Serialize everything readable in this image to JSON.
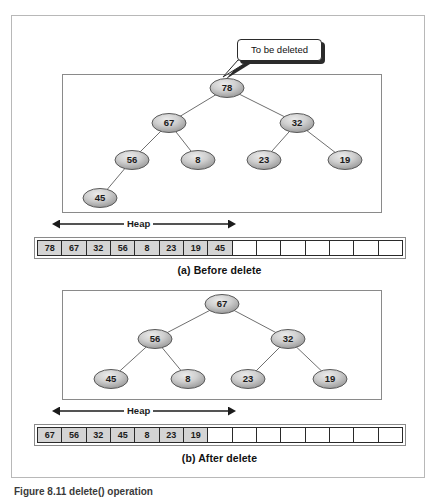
{
  "figure": {
    "caption": "Figure 8.11    delete() operation"
  },
  "callout": {
    "text": "To be deleted"
  },
  "panel_a": {
    "caption": "(a) Before delete",
    "heap_label": "Heap",
    "tree": {
      "nodes": [
        {
          "id": "a-78",
          "label": "78",
          "cx": 227,
          "cy": 88
        },
        {
          "id": "a-67",
          "label": "67",
          "cx": 169,
          "cy": 123
        },
        {
          "id": "a-32",
          "label": "32",
          "cx": 297,
          "cy": 123
        },
        {
          "id": "a-56",
          "label": "56",
          "cx": 132,
          "cy": 160
        },
        {
          "id": "a-8",
          "label": "8",
          "cx": 198,
          "cy": 160
        },
        {
          "id": "a-23",
          "label": "23",
          "cx": 264,
          "cy": 160
        },
        {
          "id": "a-19",
          "label": "19",
          "cx": 345,
          "cy": 160
        },
        {
          "id": "a-45",
          "label": "45",
          "cx": 100,
          "cy": 198
        }
      ],
      "edges": [
        {
          "from": "a-78",
          "to": "a-67"
        },
        {
          "from": "a-78",
          "to": "a-32"
        },
        {
          "from": "a-67",
          "to": "a-56"
        },
        {
          "from": "a-67",
          "to": "a-8"
        },
        {
          "from": "a-32",
          "to": "a-23"
        },
        {
          "from": "a-32",
          "to": "a-19"
        },
        {
          "from": "a-56",
          "to": "a-45"
        }
      ]
    },
    "array": {
      "total_cells": 15,
      "cells": [
        "78",
        "67",
        "32",
        "56",
        "8",
        "23",
        "19",
        "45",
        "",
        "",
        "",
        "",
        "",
        "",
        ""
      ]
    },
    "heap_arrow": {
      "x1": 60,
      "x2": 228,
      "y": 224
    }
  },
  "panel_b": {
    "caption": "(b) After delete",
    "heap_label": "Heap",
    "tree": {
      "nodes": [
        {
          "id": "b-67",
          "label": "67",
          "cx": 222,
          "cy": 304
        },
        {
          "id": "b-56",
          "label": "56",
          "cx": 155,
          "cy": 339
        },
        {
          "id": "b-32",
          "label": "32",
          "cx": 288,
          "cy": 339
        },
        {
          "id": "b-45",
          "label": "45",
          "cx": 111,
          "cy": 379
        },
        {
          "id": "b-8",
          "label": "8",
          "cx": 188,
          "cy": 379
        },
        {
          "id": "b-23",
          "label": "23",
          "cx": 248,
          "cy": 379
        },
        {
          "id": "b-19",
          "label": "19",
          "cx": 330,
          "cy": 379
        }
      ],
      "edges": [
        {
          "from": "b-67",
          "to": "b-56"
        },
        {
          "from": "b-67",
          "to": "b-32"
        },
        {
          "from": "b-56",
          "to": "b-45"
        },
        {
          "from": "b-56",
          "to": "b-8"
        },
        {
          "from": "b-32",
          "to": "b-23"
        },
        {
          "from": "b-32",
          "to": "b-19"
        }
      ]
    },
    "array": {
      "total_cells": 15,
      "cells": [
        "67",
        "56",
        "32",
        "45",
        "8",
        "23",
        "19",
        "",
        "",
        "",
        "",
        "",
        "",
        "",
        ""
      ]
    },
    "heap_arrow": {
      "x1": 60,
      "x2": 228,
      "y": 411
    }
  },
  "colors": {
    "node_fill_light": "#e2e2e2",
    "node_fill_dark": "#9a9a9a",
    "node_stroke": "#5a5a5a",
    "edge": "#6f6f6f",
    "filled_cell": "#d4d4d4",
    "frame": "#b8b8b8",
    "panel_border": "#8a8a8a"
  }
}
